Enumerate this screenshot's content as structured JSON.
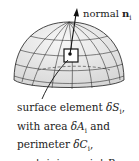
{
  "figure": {
    "type": "hemisphere-surface-element",
    "normal_label": {
      "text": "normal",
      "symbol": "n",
      "subscript": "i"
    },
    "caption_lines": [
      {
        "plain": "surface element ",
        "math": "δS",
        "sub": "i",
        "suffix": ","
      },
      {
        "plain": "with area ",
        "math": "δA",
        "sub": "i",
        "suffix": " and"
      },
      {
        "plain": "perimeter ",
        "math": "δC",
        "sub": "i",
        "suffix": ","
      },
      {
        "plain": "containing point ",
        "math": "P",
        "sub": "i",
        "suffix": ""
      }
    ],
    "colors": {
      "surface_fill": "#ececec",
      "grid": "#333333",
      "text": "#222222"
    }
  }
}
